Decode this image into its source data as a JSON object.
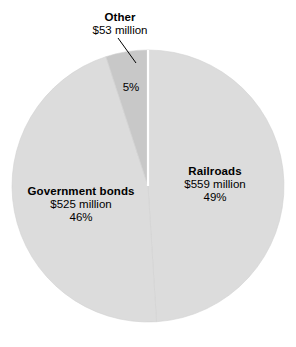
{
  "chart_data": {
    "type": "pie",
    "title": "",
    "subtitle": "",
    "xlabel": "",
    "ylabel": "",
    "legend": "none",
    "grid": false,
    "units": "million dollars",
    "total_label": "",
    "categories": [
      "Railroads",
      "Government bonds",
      "Other"
    ],
    "values": [
      559,
      525,
      53
    ],
    "percentages": [
      49,
      46,
      5
    ],
    "slices": [
      {
        "name": "Railroads",
        "label": "Railroads",
        "value": 559,
        "value_label": "$559 million",
        "percent": 49,
        "percent_label": "49%",
        "color": "#dcdcdc",
        "start_angle": 0,
        "end_angle": 176.4
      },
      {
        "name": "Government bonds",
        "label": "Government bonds",
        "value": 525,
        "value_label": "$525 million",
        "percent": 46,
        "percent_label": "46%",
        "color": "#dcdcdc",
        "start_angle": 176.4,
        "end_angle": 342.0
      },
      {
        "name": "Other",
        "label": "Other",
        "value": 53,
        "value_label": "$53 million",
        "percent": 5,
        "percent_label": "5%",
        "color": "#c8c8c8",
        "start_angle": 342.0,
        "end_angle": 360.0
      }
    ],
    "annotations": [
      {
        "name": "other-callout",
        "text": "Other $53 million",
        "leader_line": true
      }
    ],
    "colors": {
      "slice_light": "#dcdcdc",
      "slice_dark": "#c8c8c8",
      "slice_outline": "#d2d2d2",
      "separator": "#ffffff",
      "text": "#000000",
      "leader_line": "#000000",
      "background": "#ffffff"
    },
    "geometry": {
      "center_x": 148,
      "center_y": 186,
      "radius": 136
    }
  },
  "labels": {
    "other": {
      "title": "Other",
      "value": "$53 million",
      "percent": "5%"
    },
    "railroads": {
      "title": "Railroads",
      "value": "$559 million",
      "percent": "49%"
    },
    "government_bonds": {
      "title": "Government bonds",
      "value": "$525 million",
      "percent": "46%"
    }
  }
}
